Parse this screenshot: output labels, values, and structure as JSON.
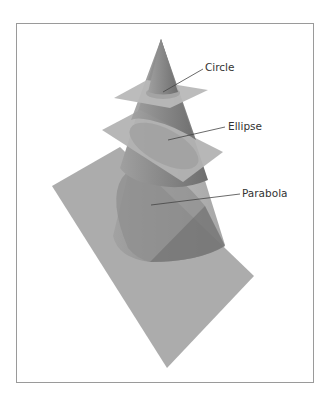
{
  "figure": {
    "labels": {
      "circle": "Circle",
      "ellipse": "Ellipse",
      "parabola": "Parabola"
    },
    "colors": {
      "frame": "#9a9a9a",
      "plane": "#a9a9a9",
      "cone": "#8e8e8e",
      "leader_line": "#444444",
      "text": "#333333"
    }
  }
}
